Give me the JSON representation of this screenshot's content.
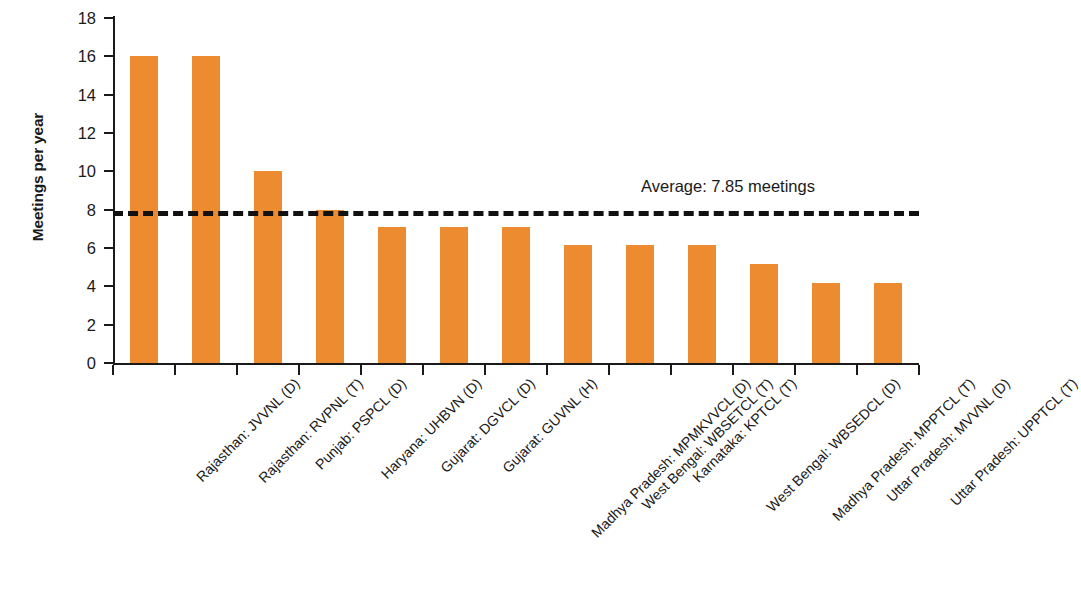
{
  "chart_data": {
    "type": "bar",
    "title": "",
    "xlabel": "",
    "ylabel": "Meetings per year",
    "ylim": [
      0,
      18
    ],
    "yticks": [
      0,
      2,
      4,
      6,
      8,
      10,
      12,
      14,
      16,
      18
    ],
    "grid": false,
    "legend": null,
    "bar_color": "#ED8B31",
    "categories": [
      "Rajasthan: JVVNL (D)",
      "Rajasthan: RVPNL (T)",
      "Punjab: PSPCL (D)",
      "Haryana: UHBVN (D)",
      "Gujarat: DGVCL (D)",
      "Gujarat: GUVNL (H)",
      "Madhya Pradesh: MPMKVVCL (D)",
      "West Bengal: WBSETCL (T)",
      "Karnataka: KPTCL (T)",
      "West Bengal: WBSEDCL (D)",
      "Madhya Pradesh: MPPTCL (T)",
      "Uttar Pradesh: MVVNL (D)",
      "Uttar Pradesh: UPPTCL (T)"
    ],
    "values": [
      16,
      16,
      10,
      8,
      7.1,
      7.1,
      7.1,
      6.15,
      6.15,
      6.15,
      5.15,
      4.2,
      4.2
    ],
    "annotations": [
      {
        "name": "average-line",
        "label": "Average: 7.85 meetings",
        "value": 7.85,
        "style": "dashed",
        "color": "#111111"
      }
    ]
  },
  "axis": {
    "y_title": "Meetings per year",
    "y_tick_labels": [
      "0",
      "2",
      "4",
      "6",
      "8",
      "10",
      "12",
      "14",
      "16",
      "18"
    ]
  },
  "average": {
    "label": "Average: 7.85 meetings"
  }
}
